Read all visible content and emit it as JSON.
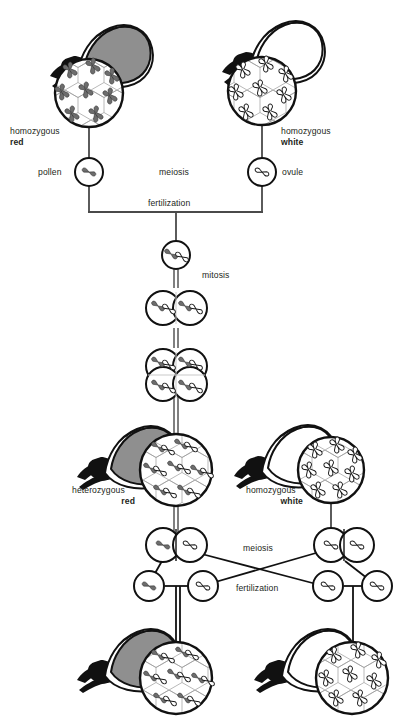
{
  "figure": {
    "watermark": "",
    "colors": {
      "line": "#231f20",
      "text": "#231f20",
      "petal_red_fill": "#8f8f8f",
      "petal_white_fill": "#ffffff",
      "chromosome_dominant_fill": "#6d6d6d",
      "chromosome_recessive_fill": "#ffffff",
      "background": "#ffffff",
      "connector_gray": "#5a5a5a"
    }
  },
  "labels": {
    "parent_left": {
      "line1": "homozygous",
      "line2": "red"
    },
    "parent_right": {
      "line1": "homozygous",
      "line2": "white"
    },
    "pollen": "pollen",
    "ovule": "ovule",
    "meiosis_top": "meiosis",
    "fertilization_top": "fertilization",
    "mitosis": "mitosis",
    "f1_left": {
      "line1": "heterozygous",
      "line2": "red"
    },
    "f1_right": {
      "line1": "homozygous",
      "line2": "white"
    },
    "meiosis_bottom": "meiosis",
    "fertilization_bottom": "fertilization"
  },
  "generations": {
    "parental": {
      "left_plant": {
        "name": "homozygous-red-parent",
        "flower_color": "red",
        "genotype": "RR",
        "tissue_chromosomes": "two filled (dominant) chromosomes per cell"
      },
      "right_plant": {
        "name": "homozygous-white-parent",
        "flower_color": "white",
        "genotype": "rr",
        "tissue_chromosomes": "two outline (recessive) chromosomes per cell"
      },
      "gametes": [
        {
          "name": "pollen",
          "chromosome": "dominant"
        },
        {
          "name": "ovule",
          "chromosome": "recessive"
        }
      ]
    },
    "zygote": {
      "name": "f1-zygote",
      "chromosomes": [
        "dominant",
        "recessive"
      ],
      "stages": [
        {
          "cells": 1,
          "label": "zygote"
        },
        {
          "cells": 2,
          "label": "two-cell"
        },
        {
          "cells": 4,
          "label": "four-cell"
        }
      ]
    },
    "f1": {
      "left_plant": {
        "name": "heterozygous-red-f1",
        "flower_color": "red",
        "genotype": "Rr",
        "tissue_chromosomes": "one filled and one outline chromosome per cell"
      },
      "right_plant": {
        "name": "homozygous-white-f1",
        "flower_color": "white",
        "genotype": "rr",
        "tissue_chromosomes": "two outline chromosomes per cell"
      },
      "meiosis_products_left": [
        "dominant",
        "recessive"
      ],
      "meiosis_products_right": [
        "recessive",
        "recessive"
      ],
      "gametes_left": [
        "dominant",
        "recessive"
      ],
      "gametes_right": [
        "recessive",
        "recessive"
      ]
    },
    "f2": {
      "left_plant": {
        "name": "heterozygous-red-f2",
        "flower_color": "red",
        "genotype": "Rr",
        "tissue_chromosomes": "one filled and one outline chromosome per cell"
      },
      "right_plant": {
        "name": "homozygous-white-f2",
        "flower_color": "white",
        "genotype": "rr",
        "tissue_chromosomes": "two outline chromosomes per cell"
      }
    }
  }
}
